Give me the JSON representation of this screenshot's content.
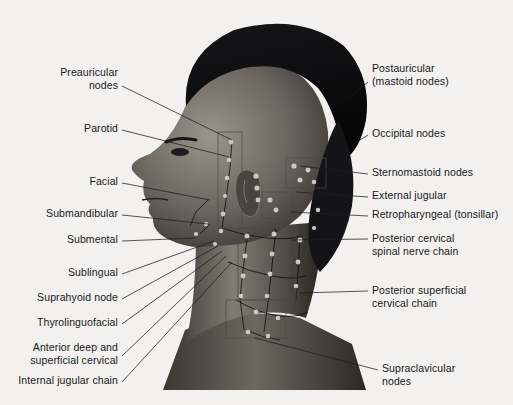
{
  "figure": {
    "background_color": "#f2f1ef",
    "text_color": "#15181c",
    "leader_line_color": "#1b1e22",
    "node_marker_color": "#cfcabf"
  },
  "labels_left": [
    {
      "id": "preauricular-nodes",
      "lines": [
        "Preauricular",
        "nodes"
      ],
      "x": 118,
      "y": 66,
      "anchor_x": 122,
      "anchor_y": 86,
      "target_x": 232,
      "target_y": 140
    },
    {
      "id": "parotid",
      "lines": [
        "Parotid"
      ],
      "x": 118,
      "y": 122,
      "anchor_x": 122,
      "anchor_y": 130,
      "target_x": 229,
      "target_y": 157
    },
    {
      "id": "facial",
      "lines": [
        "Facial"
      ],
      "x": 118,
      "y": 175,
      "anchor_x": 122,
      "anchor_y": 183,
      "target_x": 210,
      "target_y": 200
    },
    {
      "id": "submandibular",
      "lines": [
        "Submandibular"
      ],
      "x": 118,
      "y": 207,
      "anchor_x": 122,
      "anchor_y": 215,
      "target_x": 208,
      "target_y": 224
    },
    {
      "id": "submental",
      "lines": [
        "Submental"
      ],
      "x": 118,
      "y": 233,
      "anchor_x": 122,
      "anchor_y": 241,
      "target_x": 196,
      "target_y": 238
    },
    {
      "id": "sublingual",
      "lines": [
        "Sublingual"
      ],
      "x": 118,
      "y": 266,
      "anchor_x": 122,
      "anchor_y": 274,
      "target_x": 214,
      "target_y": 241
    },
    {
      "id": "suprahyoid-node",
      "lines": [
        "Suprahyoid node"
      ],
      "x": 118,
      "y": 291,
      "anchor_x": 122,
      "anchor_y": 299,
      "target_x": 218,
      "target_y": 246
    },
    {
      "id": "thyrolinguofacial",
      "lines": [
        "Thyrolinguofacial"
      ],
      "x": 118,
      "y": 316,
      "anchor_x": 122,
      "anchor_y": 324,
      "target_x": 222,
      "target_y": 251
    },
    {
      "id": "anterior-deep-superficial-cervical",
      "lines": [
        "Anterior deep and",
        "superficial cervical"
      ],
      "x": 118,
      "y": 341,
      "anchor_x": 122,
      "anchor_y": 356,
      "target_x": 226,
      "target_y": 256
    },
    {
      "id": "internal-jugular-chain",
      "lines": [
        "Internal jugular chain"
      ],
      "x": 118,
      "y": 374,
      "anchor_x": 122,
      "anchor_y": 382,
      "target_x": 232,
      "target_y": 262
    }
  ],
  "labels_right": [
    {
      "id": "postauricular-mastoid-nodes",
      "lines": [
        "Postauricular",
        "(mastoid nodes)"
      ],
      "x": 372,
      "y": 62,
      "anchor_x": 368,
      "anchor_y": 82,
      "target_x": 350,
      "target_y": 97
    },
    {
      "id": "occipital-nodes",
      "lines": [
        "Occipital nodes"
      ],
      "x": 372,
      "y": 127,
      "anchor_x": 368,
      "anchor_y": 135,
      "target_x": 352,
      "target_y": 145
    },
    {
      "id": "sternomastoid-nodes",
      "lines": [
        "Sternomastoid nodes"
      ],
      "x": 372,
      "y": 166,
      "anchor_x": 368,
      "anchor_y": 174,
      "target_x": 300,
      "target_y": 166
    },
    {
      "id": "external-jugular",
      "lines": [
        "External jugular"
      ],
      "x": 372,
      "y": 189,
      "anchor_x": 368,
      "anchor_y": 197,
      "target_x": 296,
      "target_y": 192
    },
    {
      "id": "retropharyngeal-tonsillar",
      "lines": [
        "Retropharyngeal (tonsillar)"
      ],
      "x": 372,
      "y": 208,
      "anchor_x": 368,
      "anchor_y": 216,
      "target_x": 290,
      "target_y": 212
    },
    {
      "id": "posterior-cervical-spinal-nerve-chain",
      "lines": [
        "Posterior cervical",
        "spinal nerve chain"
      ],
      "x": 372,
      "y": 232,
      "anchor_x": 368,
      "anchor_y": 239,
      "target_x": 292,
      "target_y": 240
    },
    {
      "id": "posterior-superficial-cervical-chain",
      "lines": [
        "Posterior superficial",
        "cervical chain"
      ],
      "x": 372,
      "y": 284,
      "anchor_x": 368,
      "anchor_y": 291,
      "target_x": 300,
      "target_y": 293
    },
    {
      "id": "supraclavicular-nodes",
      "lines": [
        "Supraclavicular",
        "nodes"
      ],
      "x": 382,
      "y": 362,
      "anchor_x": 378,
      "anchor_y": 370,
      "target_x": 255,
      "target_y": 338
    }
  ]
}
